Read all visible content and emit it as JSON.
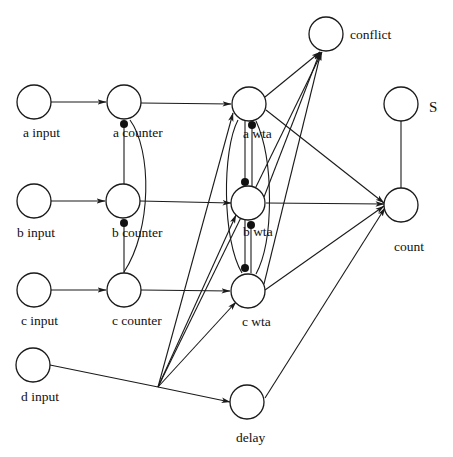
{
  "diagram": {
    "type": "neural-network-diagram",
    "nodes": {
      "a_input": {
        "label": "a input"
      },
      "b_input": {
        "label": "b input"
      },
      "c_input": {
        "label": "c input"
      },
      "d_input": {
        "label": "d input"
      },
      "a_counter": {
        "label": "a counter"
      },
      "b_counter": {
        "label": "b counter"
      },
      "c_counter": {
        "label": "c counter"
      },
      "a_wta": {
        "label": "a wta"
      },
      "b_wta": {
        "label": "b wta"
      },
      "c_wta": {
        "label": "c wta"
      },
      "delay": {
        "label": "delay"
      },
      "conflict": {
        "label": "conflict"
      },
      "s": {
        "label": "S"
      },
      "count": {
        "label": "count"
      }
    },
    "edges": [
      {
        "from": "a input",
        "to": "a counter",
        "type": "excitatory"
      },
      {
        "from": "b input",
        "to": "b counter",
        "type": "excitatory"
      },
      {
        "from": "c input",
        "to": "c counter",
        "type": "excitatory"
      },
      {
        "from": "a counter",
        "to": "a wta",
        "type": "excitatory"
      },
      {
        "from": "b counter",
        "to": "b wta",
        "type": "excitatory"
      },
      {
        "from": "c counter",
        "to": "c wta",
        "type": "excitatory"
      },
      {
        "from": "b counter",
        "to": "a counter",
        "type": "inhibitory"
      },
      {
        "from": "c counter",
        "to": "a counter",
        "type": "inhibitory"
      },
      {
        "from": "c counter",
        "to": "b counter",
        "type": "inhibitory"
      },
      {
        "from": "b wta",
        "to": "a wta",
        "type": "inhibitory"
      },
      {
        "from": "a wta",
        "to": "b wta",
        "type": "inhibitory"
      },
      {
        "from": "c wta",
        "to": "b wta",
        "type": "inhibitory"
      },
      {
        "from": "b wta",
        "to": "c wta",
        "type": "inhibitory"
      },
      {
        "from": "a wta",
        "to": "conflict",
        "type": "excitatory"
      },
      {
        "from": "b wta",
        "to": "conflict",
        "type": "excitatory"
      },
      {
        "from": "c wta",
        "to": "conflict",
        "type": "excitatory"
      },
      {
        "from": "a wta",
        "to": "count",
        "type": "excitatory"
      },
      {
        "from": "b wta",
        "to": "count",
        "type": "excitatory"
      },
      {
        "from": "c wta",
        "to": "count",
        "type": "excitatory"
      },
      {
        "from": "delay",
        "to": "count",
        "type": "excitatory"
      },
      {
        "from": "S",
        "to": "count",
        "type": "modulatory"
      },
      {
        "from": "d input",
        "to": "delay",
        "type": "excitatory"
      },
      {
        "from": "d input",
        "to": "a wta",
        "type": "excitatory"
      },
      {
        "from": "d input",
        "to": "b wta",
        "type": "excitatory"
      },
      {
        "from": "d input",
        "to": "c wta",
        "type": "excitatory"
      },
      {
        "from": "d input",
        "to": "conflict",
        "type": "excitatory"
      }
    ]
  }
}
